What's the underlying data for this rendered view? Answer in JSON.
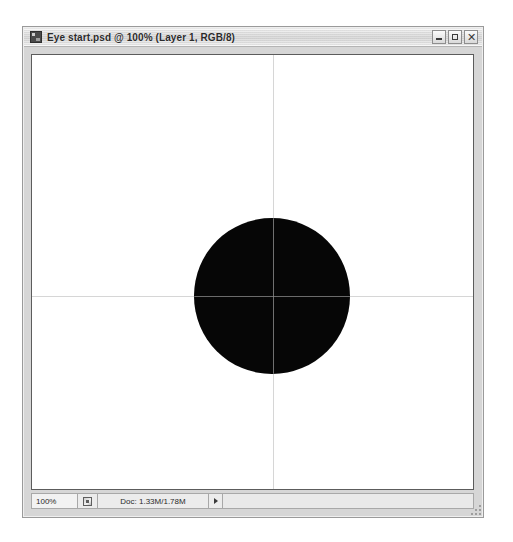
{
  "window": {
    "title": "Eye start.psd @ 100% (Layer 1, RGB/8)",
    "app_icon": "photoshop-document-icon",
    "controls": {
      "minimize_label": "",
      "maximize_label": "",
      "close_label": "✕"
    }
  },
  "status_bar": {
    "zoom_level": "100%",
    "zoom_icon": "proof-setup-icon",
    "doc_info": "Doc: 1.33M/1.78M",
    "more_caret": "▶"
  },
  "canvas": {
    "background_color": "#ffffff",
    "guides": {
      "color": "#cfcfcf",
      "over_shape_color": "#8d8d8d",
      "vertical_x_pct": 54.6,
      "horizontal_y_pct": 55.5
    },
    "shape": {
      "name": "black-circle",
      "fill_color": "#060606",
      "left_pct": 36.8,
      "top_pct": 37.6,
      "diameter_pct": 35.3
    }
  }
}
